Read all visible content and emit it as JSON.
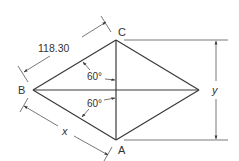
{
  "diagram": {
    "type": "rhombus-drafting-drawing",
    "vertices": {
      "top": {
        "label": "C"
      },
      "left": {
        "label": "B"
      },
      "bottom": {
        "label": "A"
      },
      "right": {
        "label": ""
      }
    },
    "dimensions": {
      "side_bc": "118.30",
      "side_ba": "x",
      "vertical": "y"
    },
    "angles": {
      "upper": "60°",
      "lower": "60°"
    },
    "colors": {
      "line": "#3a3a3a",
      "background": "#ffffff"
    }
  }
}
